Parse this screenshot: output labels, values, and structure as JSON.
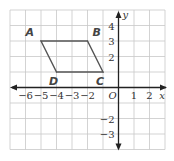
{
  "figure": {
    "type": "coordinate-plane",
    "x_range": [
      -7,
      3
    ],
    "y_range": [
      -4,
      5
    ],
    "grid": true,
    "grid_color": "#c8c8c8",
    "axis_color": "#222222",
    "shape_color": "#555555",
    "x_axis_label": "x",
    "y_axis_label": "y",
    "origin_label": "O",
    "x_ticks": [
      {
        "value": -6,
        "label": "−6"
      },
      {
        "value": -5,
        "label": "−5"
      },
      {
        "value": -4,
        "label": "−4"
      },
      {
        "value": -3,
        "label": "−3"
      },
      {
        "value": -2,
        "label": "−2"
      },
      {
        "value": 1,
        "label": "1"
      },
      {
        "value": 2,
        "label": "2"
      }
    ],
    "y_ticks": [
      {
        "value": 4,
        "label": "4"
      },
      {
        "value": 3,
        "label": "3"
      },
      {
        "value": 2,
        "label": "2"
      },
      {
        "value": -2,
        "label": "−2"
      },
      {
        "value": -3,
        "label": "−3"
      }
    ],
    "polygon": {
      "name": "parallelogram-ABCD",
      "vertices": [
        {
          "label": "A",
          "x": -5,
          "y": 3,
          "label_pos": "upper-left"
        },
        {
          "label": "B",
          "x": -2,
          "y": 3,
          "label_pos": "upper-right"
        },
        {
          "label": "C",
          "x": -1,
          "y": 1,
          "label_pos": "below"
        },
        {
          "label": "D",
          "x": -4,
          "y": 1,
          "label_pos": "below"
        }
      ]
    }
  }
}
